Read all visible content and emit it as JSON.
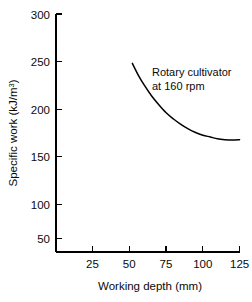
{
  "chart_data": {
    "type": "line",
    "title": "",
    "xlabel": "Working depth (mm)",
    "ylabel": "Specific work (kJ/m³)",
    "ylabel_base": "Specific work (kJ/m",
    "ylabel_sup": "3",
    "ylabel_close": ")",
    "xlim": [
      0,
      130
    ],
    "ylim": [
      40,
      300
    ],
    "grid": false,
    "legend": null,
    "xticks": [
      25,
      50,
      75,
      100,
      125
    ],
    "xtick_labels": [
      "25",
      "50",
      "75",
      "100",
      "125"
    ],
    "yticks": [
      50,
      100,
      150,
      200,
      250,
      300
    ],
    "ytick_labels": [
      "50",
      "100",
      "150",
      "200",
      "250",
      "300"
    ],
    "series": [
      {
        "name": "Rotary cultivator at 160 rpm",
        "color": "#000000",
        "x": [
          52,
          56,
          60,
          65,
          70,
          75,
          80,
          85,
          90,
          95,
          100,
          105,
          110,
          115,
          120,
          125
        ],
        "y": [
          245,
          232,
          221,
          209,
          199,
          190,
          183,
          177,
          172,
          168,
          165,
          163,
          161,
          160,
          159.5,
          160
        ]
      }
    ],
    "annotations": [
      {
        "name": "curve-annotation",
        "line1": "Rotary cultivator",
        "line2": "at 160 rpm",
        "x": 83,
        "y": 228
      }
    ]
  },
  "colors": {
    "axis": "#000000",
    "curve": "#000000",
    "text": "#0a0a0a",
    "background": "#ffffff"
  }
}
